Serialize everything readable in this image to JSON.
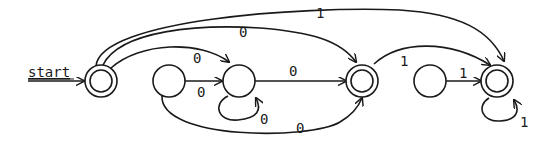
{
  "diagram": {
    "type": "finite-automaton",
    "start_label": "start",
    "colors": {
      "stroke": "#1a1a1a",
      "background": "#ffffff"
    },
    "states": [
      {
        "id": "q0",
        "accepting": true,
        "start": true
      },
      {
        "id": "q1",
        "accepting": false
      },
      {
        "id": "q2",
        "accepting": false
      },
      {
        "id": "q3",
        "accepting": true
      },
      {
        "id": "q4",
        "accepting": false
      },
      {
        "id": "q5",
        "accepting": true
      }
    ],
    "transitions": [
      {
        "from": "q0",
        "to": "q2",
        "label": "0"
      },
      {
        "from": "q0",
        "to": "q3",
        "label": "0"
      },
      {
        "from": "q0",
        "to": "q5",
        "label": "1"
      },
      {
        "from": "q1",
        "to": "q2",
        "label": "0"
      },
      {
        "from": "q1",
        "to": "q3",
        "label": "0"
      },
      {
        "from": "q2",
        "to": "q2",
        "label": "0"
      },
      {
        "from": "q2",
        "to": "q3",
        "label": "0"
      },
      {
        "from": "q3",
        "to": "q5",
        "label": "1"
      },
      {
        "from": "q4",
        "to": "q5",
        "label": "1"
      },
      {
        "from": "q5",
        "to": "q5",
        "label": "1"
      }
    ]
  }
}
